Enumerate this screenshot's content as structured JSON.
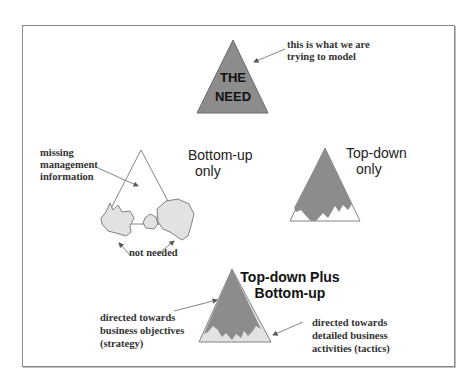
{
  "diagram": {
    "colors": {
      "dark_fill": "#8c8c8c",
      "light_fill": "#e2e2e2",
      "outline": "#555555",
      "arrow": "#666666",
      "frame": "#8a8a8a"
    },
    "the_need": {
      "label_line1": "THE",
      "label_line2": "NEED",
      "annotation_line1": "this is what we are",
      "annotation_line2": "trying to model"
    },
    "bottom_up": {
      "title_line1": "Bottom-up",
      "title_line2": "only",
      "annotation_missing_line1": "missing",
      "annotation_missing_line2": "management",
      "annotation_missing_line3": "information",
      "annotation_not_needed": "not needed"
    },
    "top_down": {
      "title_line1": "Top-down",
      "title_line2": "only"
    },
    "combined": {
      "title_line1": "Top-down Plus",
      "title_line2": "Bottom-up",
      "left_annotation_line1": "directed towards",
      "left_annotation_line2": "business objectives",
      "left_annotation_line3": "(strategy)",
      "right_annotation_line1": "directed towards",
      "right_annotation_line2": "detailed business",
      "right_annotation_line3": "activities (tactics)"
    }
  }
}
